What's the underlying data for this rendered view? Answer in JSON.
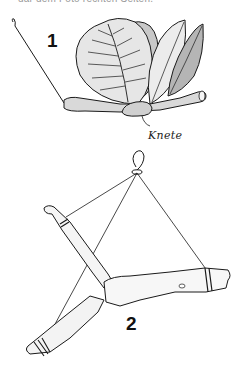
{
  "caption_top": "dar dem Foto rechten Seiten.",
  "figures": [
    {
      "number": "1",
      "description": "Leaves attached to a twig with modeling clay, with a hanging thread",
      "labels": {
        "clay": "Knete"
      }
    },
    {
      "number": "2",
      "description": "Forked branch hung with threads tied at three points and knotted into a loop"
    }
  ],
  "colors": {
    "ink": "#1a1a1a",
    "leaf_light": "#e8e8e8",
    "leaf_mid": "#cfcfcf",
    "leaf_dark": "#a9a9a9",
    "branch": "#f2f2f2"
  }
}
